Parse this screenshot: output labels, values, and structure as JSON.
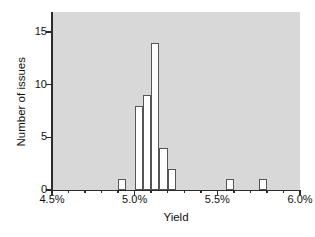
{
  "chart_data": {
    "type": "bar",
    "title": "",
    "subtitle": "",
    "xlabel": "Yield",
    "ylabel": "Number of issues",
    "xlim": [
      4.5,
      6.0
    ],
    "ylim": [
      0,
      16.9
    ],
    "grid": false,
    "legend": null,
    "bin_width": 0.05,
    "x_tick_labels": [
      "4.5%",
      "5.0%",
      "5.5%",
      "6.0%"
    ],
    "x_tick_values": [
      4.5,
      5.0,
      5.5,
      6.0
    ],
    "x_minor_tick_values": [
      4.6,
      4.7,
      4.8,
      4.9,
      5.1,
      5.2,
      5.3,
      5.4,
      5.6,
      5.7,
      5.8,
      5.9
    ],
    "y_tick_labels": [
      "0",
      "5",
      "10",
      "15"
    ],
    "y_tick_values": [
      0,
      5,
      10,
      15
    ],
    "bins": [
      {
        "start": 4.9,
        "end": 4.95,
        "value": 1
      },
      {
        "start": 4.95,
        "end": 5.0,
        "value": 0
      },
      {
        "start": 5.0,
        "end": 5.05,
        "value": 8
      },
      {
        "start": 5.05,
        "end": 5.1,
        "value": 9
      },
      {
        "start": 5.1,
        "end": 5.15,
        "value": 14
      },
      {
        "start": 5.15,
        "end": 5.2,
        "value": 4
      },
      {
        "start": 5.2,
        "end": 5.25,
        "value": 2
      },
      {
        "start": 5.55,
        "end": 5.6,
        "value": 1
      },
      {
        "start": 5.75,
        "end": 5.8,
        "value": 1
      }
    ],
    "categories": [
      "4.90-4.95",
      "5.00-5.05",
      "5.05-5.10",
      "5.10-5.15",
      "5.15-5.20",
      "5.20-5.25",
      "5.55-5.60",
      "5.75-5.80"
    ],
    "values": [
      1,
      8,
      9,
      14,
      4,
      2,
      1,
      1
    ],
    "colors": {
      "plot_background": "#d8d8d8",
      "bar_fill": "#ffffff",
      "bar_border": "#555555",
      "axis": "#2b2b2b",
      "text": "#111111",
      "page_background": "#ffffff"
    }
  }
}
